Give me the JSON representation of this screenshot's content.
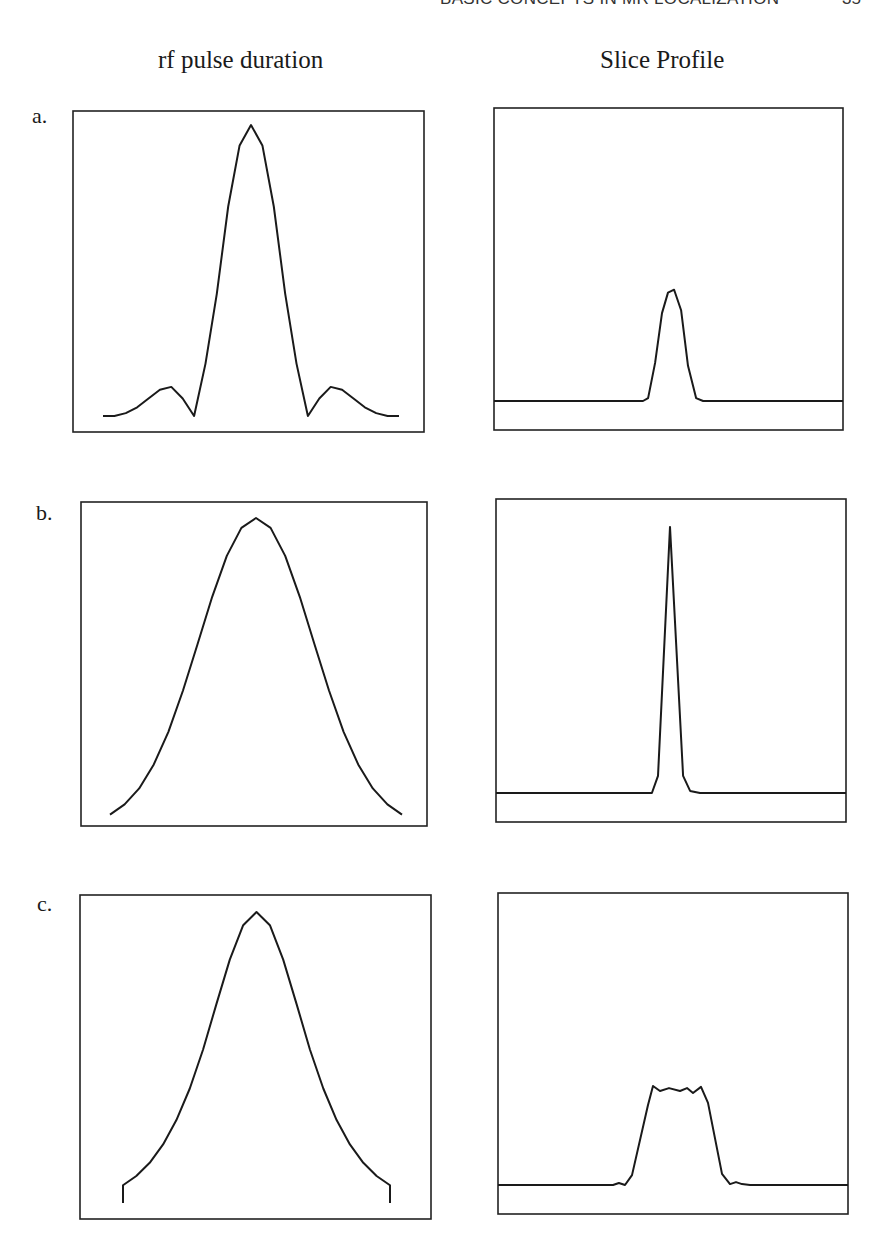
{
  "page": {
    "running_head": "BASIC CONCEPTS IN MR LOCALIZATION",
    "page_number": "35"
  },
  "columns": {
    "left_title": "rf pulse duration",
    "right_title": "Slice Profile"
  },
  "chart_data": [
    {
      "id": "a-rf",
      "type": "line",
      "panel": "a.",
      "column": "rf pulse duration",
      "title": "",
      "xlabel": "",
      "ylabel": "",
      "shape": "sinc (magnitude, windowed)",
      "xlim": [
        -2.6,
        2.6
      ],
      "ylim": [
        0,
        1
      ],
      "x": [
        -2.6,
        -2.4,
        -2.2,
        -2.0,
        -1.8,
        -1.6,
        -1.4,
        -1.2,
        -1.0,
        -0.8,
        -0.6,
        -0.4,
        -0.2,
        0,
        0.2,
        0.4,
        0.6,
        0.8,
        1.0,
        1.2,
        1.4,
        1.6,
        1.8,
        2.0,
        2.2,
        2.4,
        2.6
      ],
      "y": [
        0,
        0,
        0.01,
        0.03,
        0.06,
        0.09,
        0.1,
        0.06,
        0,
        0.18,
        0.42,
        0.72,
        0.93,
        1,
        0.93,
        0.72,
        0.42,
        0.18,
        0,
        0.06,
        0.1,
        0.09,
        0.06,
        0.03,
        0.01,
        0,
        0
      ]
    },
    {
      "id": "a-slice",
      "type": "line",
      "panel": "a.",
      "column": "Slice Profile",
      "title": "",
      "xlabel": "",
      "ylabel": "",
      "xlim": [
        -1,
        1
      ],
      "ylim": [
        0,
        1
      ],
      "x": [
        -1,
        -0.146,
        -0.117,
        -0.077,
        -0.037,
        -0.003,
        0.032,
        0.072,
        0.112,
        0.158,
        0.198,
        1
      ],
      "y": [
        0,
        0,
        0.01,
        0.13,
        0.3,
        0.37,
        0.38,
        0.31,
        0.12,
        0.01,
        0,
        0
      ]
    },
    {
      "id": "b-rf",
      "type": "line",
      "panel": "b.",
      "column": "rf pulse duration",
      "title": "",
      "xlabel": "",
      "ylabel": "",
      "shape": "gaussian",
      "xlim": [
        -1,
        1
      ],
      "ylim": [
        0,
        1
      ],
      "x": [
        -1.0,
        -0.9,
        -0.8,
        -0.7,
        -0.6,
        -0.5,
        -0.4,
        -0.3,
        -0.2,
        -0.1,
        0,
        0.1,
        0.2,
        0.3,
        0.4,
        0.5,
        0.6,
        0.7,
        0.8,
        0.9,
        1.0
      ],
      "y": [
        0.037,
        0.07,
        0.122,
        0.2,
        0.306,
        0.44,
        0.591,
        0.744,
        0.877,
        0.968,
        1,
        0.968,
        0.877,
        0.744,
        0.591,
        0.44,
        0.306,
        0.2,
        0.122,
        0.07,
        0.037
      ]
    },
    {
      "id": "b-slice",
      "type": "line",
      "panel": "b.",
      "column": "Slice Profile",
      "title": "",
      "xlabel": "",
      "ylabel": "",
      "xlim": [
        -1,
        1
      ],
      "ylim": [
        0,
        1
      ],
      "x": [
        -1,
        -0.109,
        -0.074,
        -0.006,
        0.069,
        0.109,
        0.166,
        1
      ],
      "y": [
        0,
        0,
        0.058,
        0.905,
        0.058,
        0.007,
        0,
        0
      ]
    },
    {
      "id": "c-rf",
      "type": "line",
      "panel": "c.",
      "column": "rf pulse duration",
      "title": "",
      "xlabel": "",
      "ylabel": "",
      "shape": "hyperbolic secant (truncated)",
      "xlim": [
        -1,
        1
      ],
      "ylim": [
        0,
        1
      ],
      "x": [
        -1.0,
        -1.0,
        -0.9,
        -0.8,
        -0.7,
        -0.6,
        -0.5,
        -0.4,
        -0.3,
        -0.2,
        -0.1,
        0,
        0.1,
        0.2,
        0.3,
        0.4,
        0.5,
        0.6,
        0.7,
        0.8,
        0.9,
        1.0,
        1.0
      ],
      "y": [
        0.052,
        0.11,
        0.14,
        0.183,
        0.243,
        0.322,
        0.425,
        0.552,
        0.7,
        0.845,
        0.957,
        1,
        0.957,
        0.845,
        0.7,
        0.552,
        0.425,
        0.322,
        0.243,
        0.183,
        0.14,
        0.11,
        0.052
      ]
    },
    {
      "id": "c-slice",
      "type": "line",
      "panel": "c.",
      "column": "Slice Profile",
      "title": "",
      "xlabel": "",
      "ylabel": "",
      "xlim": [
        -1,
        1
      ],
      "ylim": [
        0,
        1
      ],
      "x": [
        -1,
        -0.343,
        -0.309,
        -0.274,
        -0.234,
        -0.143,
        -0.114,
        -0.074,
        -0.023,
        0.04,
        0.08,
        0.114,
        0.16,
        0.2,
        0.28,
        0.326,
        0.36,
        0.394,
        0.44,
        1
      ],
      "y": [
        0,
        0,
        0.007,
        0,
        0.034,
        0.274,
        0.339,
        0.322,
        0.332,
        0.322,
        0.332,
        0.315,
        0.336,
        0.281,
        0.038,
        0.003,
        0.01,
        0.003,
        0,
        0
      ]
    }
  ]
}
